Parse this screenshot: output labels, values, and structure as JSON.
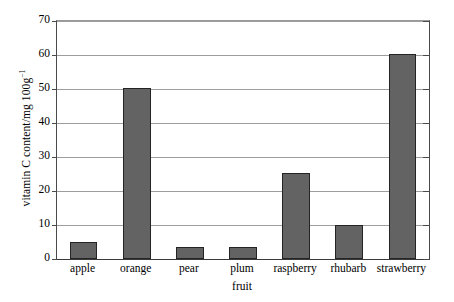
{
  "chart_data": {
    "type": "bar",
    "title": "",
    "subtitle": "",
    "xlabel": "fruit",
    "ylabel": "vitamin C content/mg 100g⁻¹",
    "ylabel_main": "vitamin C content/mg 100g",
    "ylabel_sup": "−1",
    "categories": [
      "apple",
      "orange",
      "pear",
      "plum",
      "raspberry",
      "rhubarb",
      "strawberry"
    ],
    "values": [
      5.0,
      50.3,
      3.5,
      3.5,
      25.2,
      10.1,
      60.2
    ],
    "ylim": [
      0,
      70
    ],
    "ytick_step": 10,
    "yticks": [
      0,
      10,
      20,
      30,
      40,
      50,
      60,
      70
    ],
    "ytick_labels": [
      "0",
      "10",
      "20",
      "30",
      "40",
      "50",
      "60",
      "70"
    ],
    "grid": true,
    "grid_axis": "y",
    "legend": false,
    "legend_position": "none",
    "bar_color": "#636363",
    "bar_edge_color": "#242424",
    "grid_color": "#9d9d9d",
    "axis_color": "#3a3a3a",
    "background_color": "#ffffff",
    "bar_width_ratio": 0.52,
    "annotations": []
  }
}
